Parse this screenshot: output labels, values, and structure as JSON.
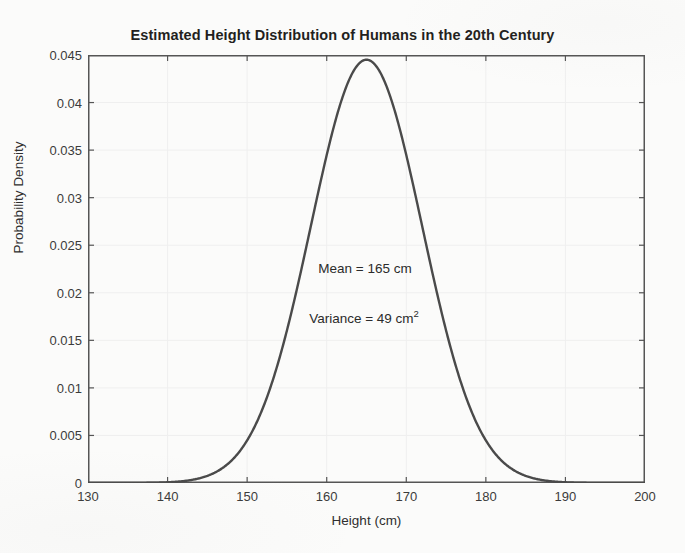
{
  "chart_data": {
    "type": "line",
    "title": "Estimated Height Distribution of Humans in the 20th Century",
    "xlabel": "Height (cm)",
    "ylabel": "Probability Density",
    "xlim": [
      130,
      200
    ],
    "ylim": [
      0,
      0.045
    ],
    "grid": true,
    "legend": null,
    "xticks": [
      130,
      140,
      150,
      160,
      170,
      180,
      190,
      200
    ],
    "xtick_labels": [
      "130",
      "140",
      "150",
      "160",
      "170",
      "180",
      "190",
      "200"
    ],
    "yticks": [
      0,
      0.005,
      0.01,
      0.015,
      0.02,
      0.025,
      0.03,
      0.035,
      0.04,
      0.045
    ],
    "ytick_labels": [
      "0",
      "0.005",
      "0.01",
      "0.015",
      "0.02",
      "0.025",
      "0.03",
      "0.035",
      "0.04",
      "0.045"
    ],
    "series": [
      {
        "name": "Normal PDF (mean 165, variance 49)",
        "color": "#4a4a4a",
        "distribution": "normal",
        "mean": 165,
        "variance": 49,
        "std_dev": 7,
        "peak_x": 165,
        "peak_y": 0.05699,
        "x": [
          130,
          132,
          134,
          136,
          138,
          140,
          142,
          144,
          146,
          148,
          150,
          152,
          154,
          156,
          158,
          160,
          162,
          164,
          165,
          166,
          168,
          170,
          172,
          174,
          176,
          178,
          180,
          182,
          184,
          186,
          188,
          190,
          192,
          194,
          196,
          198,
          200
        ],
        "y": [
          1e-05,
          3e-05,
          9e-05,
          0.00024,
          0.00058,
          0.00131,
          0.00274,
          0.00531,
          0.00956,
          0.01597,
          0.02478,
          0.03569,
          0.04768,
          0.05906,
          0.0678,
          0.07215,
          0.07115,
          0.06515,
          0.05699,
          0.05532,
          0.04341,
          0.03159,
          0.02133,
          0.01336,
          0.00776,
          0.00418,
          0.00208,
          0.00096,
          0.00041,
          0.00016,
          6e-05,
          2e-05,
          1e-05,
          2e-06,
          5e-07,
          1e-07,
          2e-08
        ]
      }
    ],
    "annotations": [
      {
        "id": "mean",
        "text_prefix": "Mean = 165 cm",
        "x": 165,
        "y": 0.0225
      },
      {
        "id": "variance",
        "text_prefix": "Variance = 49 cm",
        "superscript": "2",
        "x": 165,
        "y": 0.0175
      }
    ]
  },
  "chart": {
    "title": "Estimated Height Distribution of Humans in the 20th Century",
    "x_axis_label": "Height (cm)",
    "y_axis_label": "Probability Density",
    "annotation_mean": "Mean = 165 cm",
    "annotation_variance_text": "Variance = 49 cm",
    "annotation_variance_superscript": "2",
    "colors": {
      "curve": "#4a4a4a",
      "axis": "#555555",
      "grid": "#efefef",
      "background": "#fbfbfa",
      "text": "#2b2b2b"
    }
  }
}
